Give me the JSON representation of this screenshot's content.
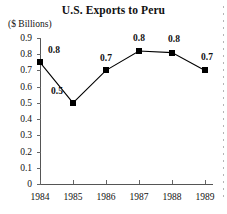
{
  "chart_data": {
    "type": "line",
    "title": "U.S. Exports to Peru",
    "subtitle": "",
    "ylabel": "($ Billions)",
    "xlabel": "",
    "categories": [
      "1984",
      "1985",
      "1986",
      "1987",
      "1988",
      "1989"
    ],
    "values": [
      0.75,
      0.5,
      0.7,
      0.82,
      0.81,
      0.7
    ],
    "data_labels": [
      "0.8",
      "0.5",
      "0.7",
      "0.8",
      "0.8",
      "0.7"
    ],
    "ylim": [
      0,
      0.9
    ],
    "y_ticks": [
      "0.9",
      "0.8",
      "0.7",
      "0.6",
      "0.5",
      "0.4",
      "0.3",
      "0.2",
      "0.1",
      "0"
    ],
    "y_tick_values": [
      0.9,
      0.8,
      0.7,
      0.6,
      0.5,
      0.4,
      0.3,
      0.2,
      0.1,
      0
    ],
    "grid": false,
    "legend": false,
    "legend_position": "none",
    "marker": "filled-square",
    "series_color": "#000000",
    "axis_color": "#555555",
    "background_color": "#ffffff"
  }
}
